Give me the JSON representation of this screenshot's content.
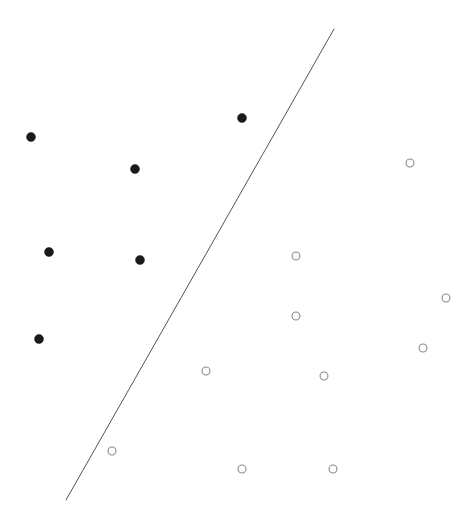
{
  "figure": {
    "title": "",
    "background_color": "#ffffff",
    "width": 474,
    "height": 524
  },
  "chart_data": {
    "type": "scatter",
    "title": "",
    "subtitle": "",
    "xlabel": "",
    "ylabel": "",
    "xlim": [
      0,
      474
    ],
    "ylim": [
      0,
      524
    ],
    "grid": false,
    "axes_visible": false,
    "tick_labels": {
      "x": [],
      "y": []
    },
    "legend": {
      "visible": false,
      "position": "none",
      "entries": []
    },
    "series": [
      {
        "name": "class-positive",
        "marker": "filled-circle",
        "marker_size_px": 9,
        "color": "#1a1a1a",
        "edge_color": "#1a1a1a",
        "points": [
          {
            "x": 31,
            "y": 137
          },
          {
            "x": 135,
            "y": 169
          },
          {
            "x": 242,
            "y": 118
          },
          {
            "x": 49,
            "y": 252
          },
          {
            "x": 140,
            "y": 260
          },
          {
            "x": 39,
            "y": 339
          }
        ]
      },
      {
        "name": "class-negative",
        "marker": "open-circle",
        "marker_size_px": 9,
        "color": "#ffffff",
        "edge_color": "#8a8a8a",
        "edge_width_px": 1.1,
        "points": [
          {
            "x": 410,
            "y": 163
          },
          {
            "x": 296,
            "y": 256
          },
          {
            "x": 296,
            "y": 316
          },
          {
            "x": 446,
            "y": 298
          },
          {
            "x": 423,
            "y": 348
          },
          {
            "x": 324,
            "y": 376
          },
          {
            "x": 206,
            "y": 371
          },
          {
            "x": 112,
            "y": 451
          },
          {
            "x": 242,
            "y": 469
          },
          {
            "x": 333,
            "y": 469
          }
        ]
      }
    ],
    "annotations": [
      {
        "name": "decision-boundary-line",
        "type": "line",
        "label": "",
        "color": "#555555",
        "width_px": 1,
        "x1": 334,
        "y1": 29,
        "x2": 66,
        "y2": 500
      }
    ]
  },
  "accessibility": {
    "description": "Scatter plot with six filled black dots on the upper-left side and ten open circles on the lower-right side, divided by a single straight diagonal line running from upper-right to lower-left."
  }
}
